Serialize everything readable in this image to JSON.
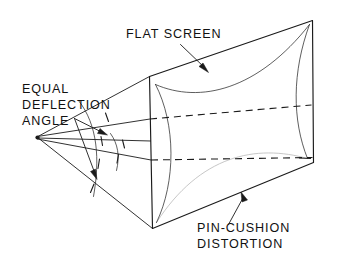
{
  "figure": {
    "title": "Flat screen deflection and pin-cushion distortion",
    "background_color": "#ffffff",
    "ink_color": "#1a1a1a",
    "labels": {
      "flat_screen": "FLAT SCREEN",
      "equal_line1": "EQUAL",
      "equal_line2": "DEFLECTION",
      "equal_line3": "ANGLE",
      "pincushion_line1": "PIN-CUSHION",
      "pincushion_line2": "DISTORTION"
    },
    "annotations": {
      "deflection_center": "deflection-center-apex",
      "screen_plane": "flat-screen-plane",
      "raster_outline": "pin-cushion-raster-outline",
      "equal_angle_arc": "equal-angle-arc",
      "ray_count": "5",
      "angle_tick_count": "4"
    }
  }
}
